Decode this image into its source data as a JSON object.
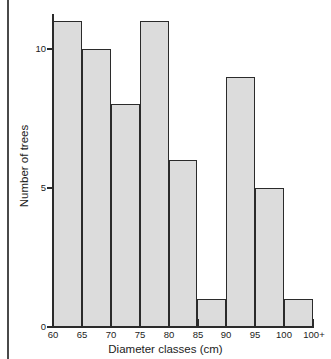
{
  "chart_data": {
    "type": "bar",
    "title": "",
    "xlabel": "Diameter classes (cm)",
    "ylabel": "Number of trees",
    "categories": [
      "60",
      "65",
      "70",
      "75",
      "80",
      "85",
      "90",
      "95",
      "100"
    ],
    "values": [
      11,
      10,
      8,
      11,
      6,
      1,
      9,
      5,
      1
    ],
    "xtick_labels": [
      "60",
      "65",
      "70",
      "75",
      "80",
      "85",
      "90",
      "95",
      "100",
      "100+"
    ],
    "ytick_labels": [
      "0",
      "5",
      "10"
    ],
    "ytick_values": [
      0,
      5,
      10
    ],
    "ylim": [
      0,
      11.25
    ],
    "xlim": [
      60,
      105
    ],
    "grid": false,
    "legend": null,
    "bar_fill_color": "#dcdcdc",
    "bar_edge_color": "#2b2b2b",
    "axis_color": "#2b2b2b",
    "background_color": "#ffffff"
  }
}
